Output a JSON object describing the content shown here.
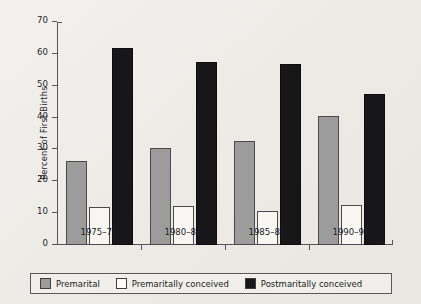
{
  "chart_data": {
    "type": "bar",
    "title": "",
    "xlabel": "",
    "ylabel": "Percent of First Births",
    "ylim": [
      0,
      70
    ],
    "yticks": [
      0,
      10,
      20,
      30,
      40,
      50,
      60,
      70
    ],
    "grid": false,
    "legend_position": "bottom",
    "categories": [
      "1975–79",
      "1980–84",
      "1985–89",
      "1990–94"
    ],
    "series": [
      {
        "name": "Premarital",
        "color": "#9c9c9c",
        "values": [
          26.3,
          30.4,
          32.8,
          40.4
        ]
      },
      {
        "name": "Premaritally conceived",
        "color": "#f7f6f3",
        "values": [
          12.0,
          12.4,
          10.8,
          12.7
        ]
      },
      {
        "name": "Postmaritally conceived",
        "color": "#17171a",
        "values": [
          61.7,
          57.6,
          56.7,
          47.4
        ]
      }
    ]
  },
  "axes": {
    "y_title": "Percent of First Births",
    "y_tick_labels": [
      "0",
      "10",
      "20",
      "30",
      "40",
      "50",
      "60",
      "70"
    ],
    "x_tick_labels": [
      "1975–79",
      "1980–84",
      "1985–89",
      "1990–94"
    ]
  },
  "legend": {
    "items": [
      {
        "label": "Premarital"
      },
      {
        "label": "Premaritally conceived"
      },
      {
        "label": "Postmaritally conceived"
      }
    ]
  },
  "colors": {
    "background": "#efeeea",
    "axis": "#55555a",
    "premarital": "#9c9c9c",
    "premaritally_conceived": "#f7f6f3",
    "postmaritally_conceived": "#17171a"
  }
}
